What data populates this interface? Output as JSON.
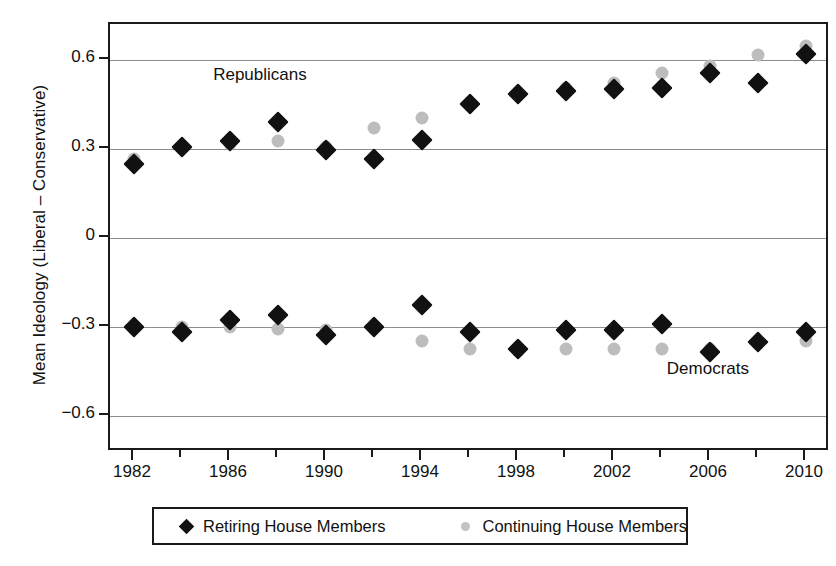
{
  "chart_data": {
    "type": "scatter",
    "title": "",
    "xlabel": "",
    "ylabel": "Mean Ideology (Liberal – Conservative)",
    "xlim": [
      1981,
      2011
    ],
    "ylim": [
      -0.72,
      0.72
    ],
    "ytick_labels": [
      "0.6",
      "0.3",
      "0",
      "-0.3",
      "-0.6"
    ],
    "ytick_values": [
      0.6,
      0.3,
      0,
      -0.3,
      -0.6
    ],
    "xtick_labels": [
      "1982",
      "1986",
      "1990",
      "1994",
      "1998",
      "2002",
      "2006",
      "2010"
    ],
    "xtick_values": [
      1982,
      1986,
      1990,
      1994,
      1998,
      2002,
      2006,
      2010
    ],
    "x": [
      1982,
      1984,
      1986,
      1988,
      1990,
      1992,
      1994,
      1996,
      1998,
      2000,
      2002,
      2004,
      2006,
      2008,
      2010
    ],
    "grid": true,
    "legend_position": "bottom",
    "annotations": [
      {
        "text": "Republicans",
        "x": 1985.3,
        "y": 0.545
      },
      {
        "text": "Democrats",
        "x": 2004.2,
        "y": -0.445
      }
    ],
    "series": [
      {
        "name": "Retiring House Members",
        "group": "Republicans",
        "marker": "diamond",
        "color": "#111111",
        "values": [
          0.25,
          0.305,
          0.325,
          0.39,
          0.295,
          0.265,
          0.33,
          0.45,
          0.485,
          0.495,
          0.5,
          0.505,
          0.555,
          0.52,
          0.62
        ]
      },
      {
        "name": "Continuing House Members",
        "group": "Republicans",
        "marker": "circle",
        "color": "#bdbdbd",
        "values": [
          0.265,
          0.305,
          0.315,
          0.325,
          0.305,
          0.37,
          0.405,
          0.455,
          0.48,
          0.505,
          0.52,
          0.555,
          0.58,
          0.615,
          0.645
        ]
      },
      {
        "name": "Retiring House Members",
        "group": "Democrats",
        "marker": "diamond",
        "color": "#111111",
        "values": [
          -0.3,
          -0.315,
          -0.275,
          -0.26,
          -0.325,
          -0.3,
          -0.225,
          -0.315,
          -0.375,
          -0.31,
          -0.31,
          -0.29,
          -0.385,
          -0.35,
          -0.315
        ]
      },
      {
        "name": "Continuing House Members",
        "group": "Democrats",
        "marker": "circle",
        "color": "#bdbdbd",
        "values": [
          -0.3,
          -0.3,
          -0.3,
          -0.305,
          -0.31,
          -0.3,
          -0.345,
          -0.375,
          -0.38,
          -0.375,
          -0.375,
          -0.375,
          -0.375,
          -0.355,
          -0.345
        ]
      }
    ]
  },
  "legend": {
    "items": [
      {
        "label": "Retiring House Members",
        "marker": "diamond-marker-icon"
      },
      {
        "label": "Continuing House Members",
        "marker": "circle-marker-icon"
      }
    ]
  },
  "colors": {
    "retiring": "#111111",
    "continuing": "#bdbdbd",
    "axis": "#1a1a1a",
    "grid": "#8d8d8d"
  }
}
